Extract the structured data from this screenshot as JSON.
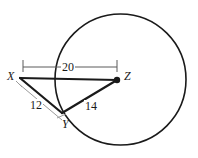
{
  "figure": {
    "kind": "circle-with-inscribed-triangle",
    "background_color": "#ffffff",
    "stroke_color": "#1a1a1a",
    "leader_color": "#9a9a9a",
    "vertices": [
      {
        "name": "X",
        "label": "X",
        "x": 20,
        "y": 78,
        "dot": false
      },
      {
        "name": "Y",
        "label": "Y",
        "x": 62,
        "y": 113,
        "dot": false
      },
      {
        "name": "Z",
        "label": "Z",
        "x": 117,
        "y": 80,
        "dot": true
      }
    ],
    "circle": {
      "center_x": 120.5,
      "center_y": 79.5,
      "radius": 65.5
    },
    "segments": [
      {
        "name": "segment-XZ",
        "from": "X",
        "to": "Z"
      },
      {
        "name": "segment-XY",
        "from": "X",
        "to": "Y"
      },
      {
        "name": "segment-YZ",
        "from": "Y",
        "to": "Z"
      }
    ],
    "measurements": [
      {
        "name": "measure-XZ",
        "value": "20",
        "for": "segment-XZ"
      },
      {
        "name": "measure-XY",
        "value": "12",
        "for": "segment-XY"
      },
      {
        "name": "measure-YZ",
        "value": "14",
        "for": "segment-YZ"
      }
    ]
  }
}
